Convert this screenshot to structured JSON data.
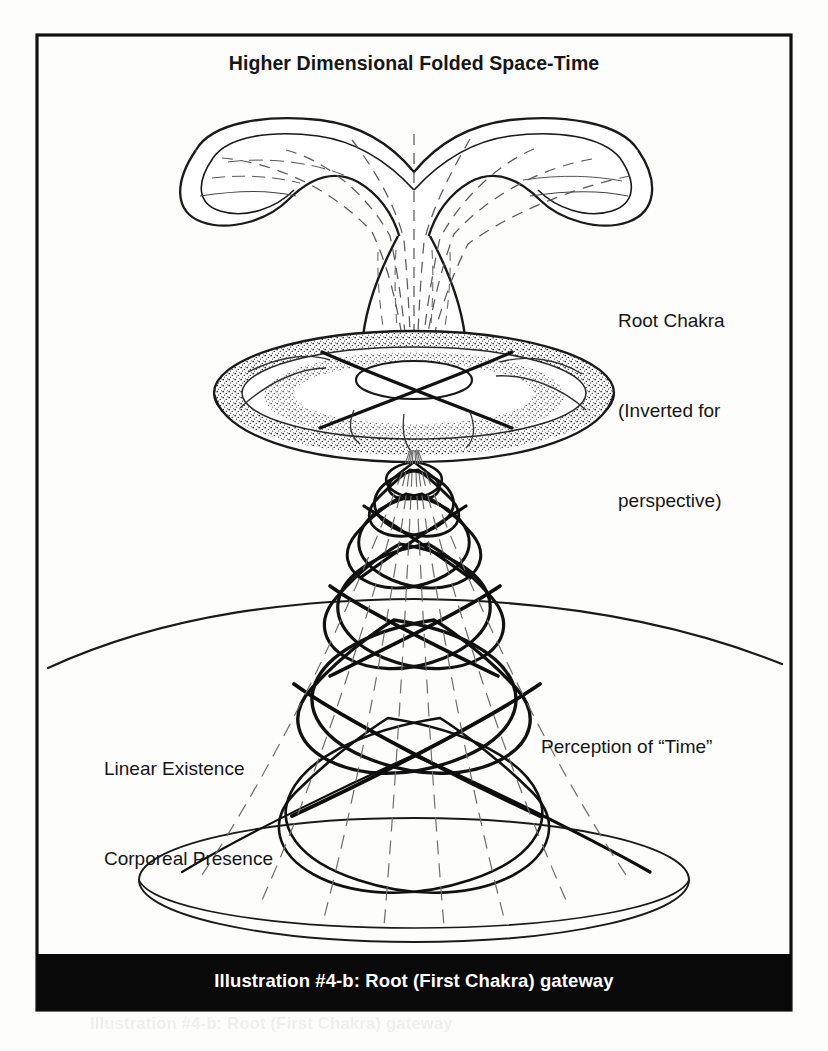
{
  "figure": {
    "title": "Higher Dimensional Folded Space-Time",
    "caption": "Illustration #4-b: Root (First Chakra) gateway",
    "labels": {
      "root_chakra_line1": "Root Chakra",
      "root_chakra_line2": "(Inverted for",
      "root_chakra_line3": "perspective)",
      "linear_line1": "Linear Existence",
      "linear_line2": "Corporeal Presence",
      "time": "Perception of “Time”"
    },
    "ghost_text": "Illustration #4-b: Root (First Chakra) gateway",
    "colors": {
      "ink": "#161616",
      "paper": "#fdfdfc",
      "caption_bar": "#090909",
      "caption_text": "#ffffff",
      "frame": "#111111"
    },
    "frame": {
      "x": 37,
      "y": 35,
      "width": 754,
      "height": 975,
      "stroke_width": 3
    }
  }
}
